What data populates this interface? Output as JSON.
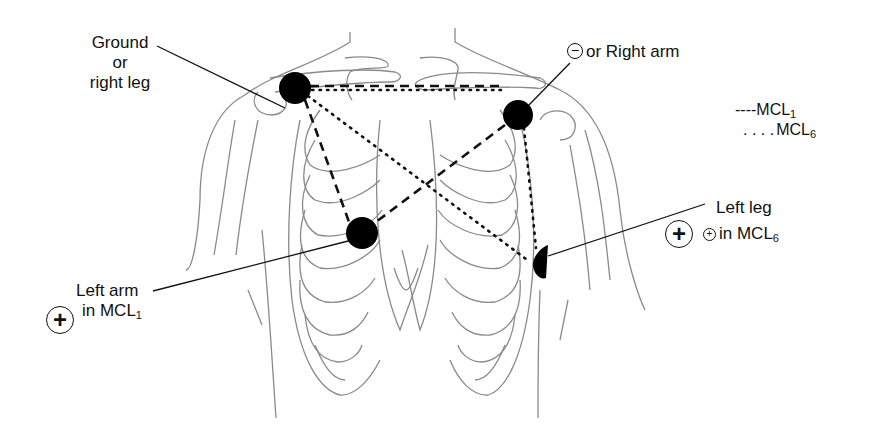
{
  "diagram": {
    "electrodes": [
      {
        "id": "ground",
        "label_lines": [
          "Ground",
          "or",
          "right leg"
        ],
        "x": 295,
        "y": 88
      },
      {
        "id": "negative",
        "symbol": "⊖",
        "label": "or Right arm",
        "x": 518,
        "y": 115
      },
      {
        "id": "left-arm",
        "label_line1": "Left arm",
        "label_line2": "in MCL",
        "label_line2_sub": "1",
        "polarity": "+",
        "x": 362,
        "y": 233
      },
      {
        "id": "left-leg",
        "label_line1": "Left leg",
        "label_line2": "in MCL",
        "label_line2_sub": "6",
        "polarity": "+",
        "small_symbol": "+",
        "x": 541,
        "y": 263
      }
    ],
    "legend": [
      {
        "style": "dashed",
        "marker": "----",
        "label": "MCL",
        "sub": "1"
      },
      {
        "style": "dotted",
        "marker": ". . . .",
        "label": "MCL",
        "sub": "6"
      }
    ],
    "colors": {
      "electrode": "#000000",
      "anatomy": "#8a8a8a",
      "leader": "#111111"
    }
  }
}
